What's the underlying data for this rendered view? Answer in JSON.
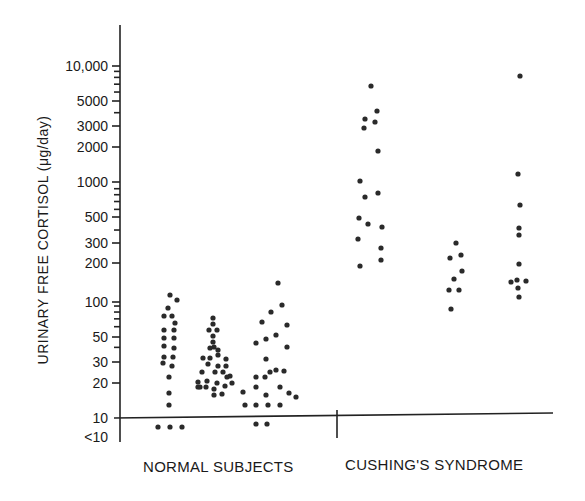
{
  "chart_data": {
    "type": "scatter",
    "subtype": "dot-strip-plot",
    "title": "",
    "xlabel": "",
    "ylabel": "URINARY FREE CORTISOL (μg/day)",
    "yscale": "log",
    "ylim": [
      10,
      10000
    ],
    "grid": false,
    "legend": null,
    "yticks": [
      {
        "label": "10,000",
        "value": 10000
      },
      {
        "label": "5000",
        "value": 5000
      },
      {
        "label": "3000",
        "value": 3000
      },
      {
        "label": "2000",
        "value": 2000
      },
      {
        "label": "1000",
        "value": 1000
      },
      {
        "label": "500",
        "value": 500
      },
      {
        "label": "300",
        "value": 300
      },
      {
        "label": "200",
        "value": 200
      },
      {
        "label": "100",
        "value": 100
      },
      {
        "label": "50",
        "value": 50
      },
      {
        "label": "30",
        "value": 30
      },
      {
        "label": "20",
        "value": 20
      },
      {
        "label": "10",
        "value": 10
      },
      {
        "label": "<10",
        "value": "<10"
      }
    ],
    "groups": [
      {
        "label": "NORMAL SUBJECTS",
        "subgroups": 3
      },
      {
        "label": "CUSHING'S SYNDROME",
        "subgroups": 3
      }
    ],
    "series": [
      {
        "name": "Normal subjects - column 1",
        "group": "NORMAL SUBJECTS",
        "points_px": [
          [
            170,
            295
          ],
          [
            177,
            300
          ],
          [
            168,
            308
          ],
          [
            164,
            316
          ],
          [
            172,
            316
          ],
          [
            175,
            323
          ],
          [
            164,
            330
          ],
          [
            174,
            330
          ],
          [
            164,
            338
          ],
          [
            174,
            338
          ],
          [
            164,
            346
          ],
          [
            174,
            348
          ],
          [
            164,
            357
          ],
          [
            173,
            357
          ],
          [
            163,
            363
          ],
          [
            172,
            366
          ],
          [
            169,
            377
          ],
          [
            169,
            393
          ],
          [
            169,
            405
          ],
          [
            158,
            427
          ],
          [
            170,
            427
          ],
          [
            182,
            427
          ]
        ],
        "values_approx": [
          110,
          100,
          85,
          75,
          75,
          65,
          58,
          58,
          50,
          50,
          43,
          41,
          35,
          35,
          31,
          29,
          24,
          17,
          13,
          "<10",
          "<10",
          "<10"
        ]
      },
      {
        "name": "Normal subjects - column 2",
        "group": "NORMAL SUBJECTS",
        "points_px": [
          [
            213,
            318
          ],
          [
            213,
            324
          ],
          [
            209,
            330
          ],
          [
            217,
            330
          ],
          [
            213,
            336
          ],
          [
            213,
            342
          ],
          [
            214,
            347
          ],
          [
            210,
            348
          ],
          [
            218,
            350
          ],
          [
            203,
            358
          ],
          [
            210,
            358
          ],
          [
            218,
            355
          ],
          [
            226,
            359
          ],
          [
            226,
            366
          ],
          [
            208,
            364
          ],
          [
            218,
            366
          ],
          [
            202,
            372
          ],
          [
            215,
            372
          ],
          [
            223,
            372
          ],
          [
            230,
            376
          ],
          [
            198,
            382
          ],
          [
            207,
            381
          ],
          [
            217,
            383
          ],
          [
            227,
            377
          ],
          [
            232,
            383
          ],
          [
            198,
            387
          ],
          [
            206,
            387
          ],
          [
            214,
            389
          ],
          [
            225,
            386
          ],
          [
            222,
            394
          ],
          [
            214,
            395
          ],
          [
            200,
            387
          ]
        ],
        "values_approx": [
          73,
          65,
          58,
          58,
          51,
          45,
          41,
          40,
          38,
          33,
          33,
          35,
          32,
          28,
          29,
          28,
          25,
          25,
          25,
          23,
          19,
          19,
          19,
          21,
          19,
          17,
          17,
          17,
          17,
          15,
          15,
          17
        ]
      },
      {
        "name": "Normal subjects - column 3",
        "group": "NORMAL SUBJECTS",
        "points_px": [
          [
            278,
            283
          ],
          [
            282,
            305
          ],
          [
            271,
            312
          ],
          [
            262,
            322
          ],
          [
            287,
            325
          ],
          [
            276,
            335
          ],
          [
            256,
            343
          ],
          [
            266,
            339
          ],
          [
            287,
            347
          ],
          [
            266,
            359
          ],
          [
            276,
            370
          ],
          [
            256,
            377
          ],
          [
            265,
            377
          ],
          [
            270,
            372
          ],
          [
            284,
            371
          ],
          [
            243,
            392
          ],
          [
            256,
            387
          ],
          [
            266,
            395
          ],
          [
            280,
            387
          ],
          [
            289,
            393
          ],
          [
            296,
            397
          ],
          [
            245,
            405
          ],
          [
            256,
            405
          ],
          [
            268,
            405
          ],
          [
            280,
            405
          ],
          [
            256,
            424
          ],
          [
            267,
            424
          ]
        ],
        "values_approx": [
          140,
          90,
          78,
          64,
          60,
          50,
          42,
          45,
          40,
          33,
          26,
          23,
          23,
          25,
          26,
          17,
          19,
          16,
          19,
          17,
          15,
          13,
          13,
          13,
          13,
          "<10",
          "<10"
        ]
      },
      {
        "name": "Cushing's syndrome - column 1",
        "group": "CUSHING'S SYNDROME",
        "points_px": [
          [
            371,
            86
          ],
          [
            377,
            111
          ],
          [
            365,
            119
          ],
          [
            375,
            122
          ],
          [
            364,
            128
          ],
          [
            378,
            151
          ],
          [
            360,
            181
          ],
          [
            378,
            193
          ],
          [
            365,
            197
          ],
          [
            359,
            218
          ],
          [
            368,
            224
          ],
          [
            382,
            227
          ],
          [
            358,
            239
          ],
          [
            381,
            248
          ],
          [
            381,
            260
          ],
          [
            360,
            266
          ]
        ],
        "values_approx": [
          6700,
          4000,
          3500,
          3200,
          2800,
          1800,
          1000,
          800,
          720,
          480,
          430,
          400,
          320,
          270,
          210,
          190
        ]
      },
      {
        "name": "Cushing's syndrome - column 2",
        "group": "CUSHING'S SYNDROME",
        "points_px": [
          [
            456,
            243
          ],
          [
            461,
            255
          ],
          [
            450,
            258
          ],
          [
            462,
            271
          ],
          [
            454,
            279
          ],
          [
            449,
            290
          ],
          [
            459,
            290
          ],
          [
            451,
            309
          ]
        ],
        "values_approx": [
          300,
          240,
          220,
          170,
          145,
          120,
          120,
          85
        ]
      },
      {
        "name": "Cushing's syndrome - column 3",
        "group": "CUSHING'S SYNDROME",
        "points_px": [
          [
            520,
            76
          ],
          [
            518,
            174
          ],
          [
            520,
            205
          ],
          [
            519,
            228
          ],
          [
            519,
            235
          ],
          [
            519,
            264
          ],
          [
            517,
            280
          ],
          [
            511,
            282
          ],
          [
            526,
            281
          ],
          [
            518,
            288
          ],
          [
            519,
            297
          ]
        ],
        "values_approx": [
          8000,
          1200,
          640,
          400,
          360,
          200,
          150,
          145,
          145,
          125,
          110
        ]
      }
    ]
  },
  "axis": {
    "ylabel": "URINARY FREE CORTISOL (μg/day)",
    "ticks": [
      {
        "label": "10,000",
        "y": 66
      },
      {
        "label": "5000",
        "y": 101
      },
      {
        "label": "3000",
        "y": 126
      },
      {
        "label": "2000",
        "y": 147
      },
      {
        "label": "1000",
        "y": 182
      },
      {
        "label": "500",
        "y": 217
      },
      {
        "label": "300",
        "y": 243
      },
      {
        "label": "200",
        "y": 263
      },
      {
        "label": "100",
        "y": 302
      },
      {
        "label": "50",
        "y": 337
      },
      {
        "label": "30",
        "y": 362
      },
      {
        "label": "20",
        "y": 383
      },
      {
        "label": "10",
        "y": 418
      },
      {
        "label": "<10",
        "y": 437
      }
    ]
  },
  "groups": {
    "normal": "NORMAL SUBJECTS",
    "cushing": "CUSHING'S SYNDROME"
  },
  "colors": {
    "ink": "#1a1a1a",
    "dot": "#2a2a2a",
    "background": "#ffffff"
  }
}
